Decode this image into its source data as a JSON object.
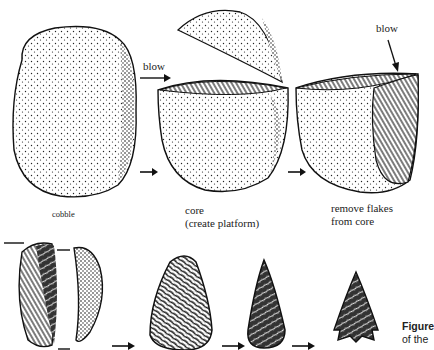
{
  "figure": {
    "labels": {
      "cobble": "cobble",
      "blow_left": "blow",
      "blow_right": "blow",
      "core_line1": "core",
      "core_line2": "(create platform)",
      "remove_line1": "remove flakes",
      "remove_line2": "from core"
    },
    "caption": {
      "line1_bold": "Figure",
      "line2": "of the"
    },
    "stages_top": [
      "cobble",
      "core (create platform)",
      "remove flakes from core"
    ],
    "stages_bottom": [
      "flake blanks",
      "biface preform",
      "refined point",
      "notched point"
    ],
    "colors": {
      "ink": "#111111",
      "paper": "#ffffff"
    }
  }
}
